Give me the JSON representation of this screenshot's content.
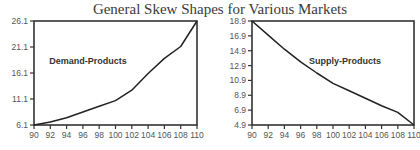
{
  "title": "General Skew Shapes for Various Markets",
  "chart_data": [
    {
      "type": "line",
      "title": "General Skew Shapes for Various Markets",
      "annotation": "Demand-Products",
      "xlabel": "",
      "ylabel": "",
      "x": [
        90,
        92,
        94,
        96,
        98,
        100,
        102,
        104,
        106,
        108,
        110
      ],
      "series": [
        {
          "name": "Demand-Products",
          "values": [
            6.1,
            6.7,
            7.5,
            8.6,
            9.7,
            10.8,
            12.8,
            16.0,
            18.9,
            21.2,
            26.1
          ]
        }
      ],
      "xticks": [
        "90",
        "92",
        "94",
        "96",
        "98",
        "100",
        "102",
        "104",
        "106",
        "108",
        "110"
      ],
      "yticks": [
        "6.1",
        "11.1",
        "16.1",
        "21.1",
        "26.1"
      ],
      "xlim": [
        90,
        110
      ],
      "ylim": [
        6.1,
        26.1
      ],
      "grid": false,
      "legend": "none"
    },
    {
      "type": "line",
      "title": "General Skew Shapes for Various Markets",
      "annotation": "Supply-Products",
      "xlabel": "",
      "ylabel": "",
      "x": [
        90,
        92,
        94,
        96,
        98,
        100,
        102,
        104,
        106,
        108,
        110
      ],
      "series": [
        {
          "name": "Supply-Products",
          "values": [
            18.9,
            17.0,
            15.1,
            13.4,
            11.9,
            10.5,
            9.5,
            8.5,
            7.5,
            6.6,
            4.9
          ]
        }
      ],
      "xticks": [
        "90",
        "92",
        "94",
        "96",
        "98",
        "100",
        "102",
        "104",
        "106",
        "108",
        "110"
      ],
      "yticks": [
        "4.9",
        "6.9",
        "8.9",
        "10.9",
        "12.9",
        "14.9",
        "16.9",
        "18.9"
      ],
      "xlim": [
        90,
        110
      ],
      "ylim": [
        4.9,
        18.9
      ],
      "grid": false,
      "legend": "none"
    }
  ]
}
